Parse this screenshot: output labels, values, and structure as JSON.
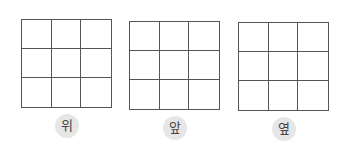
{
  "views": [
    {
      "label": "위",
      "rows": 3,
      "cols": 3
    },
    {
      "label": "앞",
      "rows": 3,
      "cols": 3
    },
    {
      "label": "옆",
      "rows": 3,
      "cols": 3
    }
  ]
}
